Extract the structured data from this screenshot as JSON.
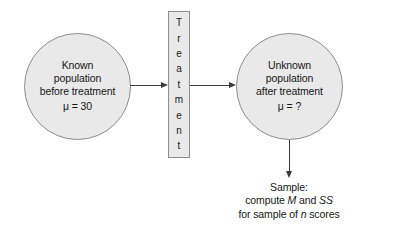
{
  "figure": {
    "type": "research-study-flow-diagram",
    "background_color": "#ffffff",
    "shape_fill_color": "#e9e9e9",
    "shape_border_color": "#8d8d8d",
    "arrow_color": "#3a3a3a",
    "text_color": "#171717"
  },
  "before_population": {
    "line1": "Known",
    "line2": "population",
    "line3": "before treatment",
    "parameter": "μ = 30"
  },
  "treatment": {
    "label": "Treatment",
    "letters": [
      "T",
      "r",
      "e",
      "a",
      "t",
      "m",
      "e",
      "n",
      "t"
    ]
  },
  "after_population": {
    "line1": "Unknown",
    "line2": "population",
    "line3": "after treatment",
    "parameter": "μ = ?"
  },
  "sample_caption": {
    "line1": "Sample:",
    "line2_prefix": "compute ",
    "line2_stat1": "M",
    "line2_middle": " and ",
    "line2_stat2": "SS",
    "line3_prefix": "for sample of ",
    "line3_stat": "n",
    "line3_suffix": " scores"
  },
  "arrows": {
    "before_to_treatment": "→",
    "treatment_to_after": "→",
    "after_to_sample": "↓"
  }
}
